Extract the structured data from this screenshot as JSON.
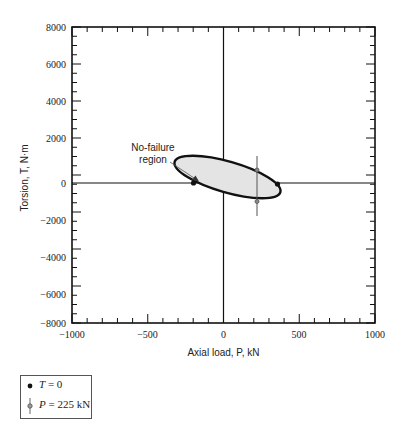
{
  "chart_data": {
    "type": "line",
    "title": "",
    "xlabel": "Axial load, P, kN",
    "ylabel": "Torsion, T, N·m",
    "xlim": [
      -1000,
      1000
    ],
    "ylim": [
      -8000,
      8000
    ],
    "x_ticks": [
      -1000,
      -500,
      0,
      500,
      1000
    ],
    "x_tick_labels": [
      "−1000",
      "−500",
      "0",
      "500",
      "1000"
    ],
    "y_ticks": [
      -8000,
      -6000,
      -4000,
      -2000,
      0,
      2000,
      4000,
      6000,
      8000
    ],
    "y_tick_labels": [
      "−8000",
      "−6000",
      "−4000",
      "−2000",
      "0",
      "2000",
      "4000",
      "6000",
      "8000"
    ],
    "grid": false,
    "series": [
      {
        "name": "No-failure region (ellipse boundary)",
        "shape": "ellipse",
        "fill": "#e6e6e6",
        "stroke": "#111111",
        "extent_P": [
          -330,
          375
        ],
        "extent_T": [
          -1600,
          1700
        ]
      },
      {
        "name": "T = 0",
        "marker": "filled-circle",
        "points": [
          {
            "P": -200,
            "T": 0
          },
          {
            "P": 360,
            "T": 0
          }
        ]
      },
      {
        "name": "P = 225 kN",
        "marker": "open-circle-with-vertical-line",
        "points": [
          {
            "P": 225,
            "T": 700
          },
          {
            "P": 225,
            "T": -1000
          }
        ],
        "line_T_range": [
          -1800,
          1500
        ]
      }
    ],
    "annotations": [
      {
        "text": "No-failure\nregion",
        "arrow_to": {
          "P": -100,
          "T": 800
        }
      }
    ],
    "legend": {
      "position": "bottom-left-outside",
      "entries": [
        "T = 0",
        "P = 225 kN"
      ]
    }
  },
  "labels": {
    "xlabel": "Axial load, P, kN",
    "ylabel": "Torsion, T, N·m",
    "annot_line1": "No-failure",
    "annot_line2": "region",
    "legend_t_var": "T",
    "legend_t_rest": " = 0",
    "legend_p_var": "P",
    "legend_p_rest": " = 225 kN",
    "x_ticks": [
      "−1000",
      "−500",
      "0",
      "500",
      "1000"
    ],
    "y_ticks": [
      "8000",
      "6000",
      "4000",
      "2000",
      "0",
      "−2000",
      "−4000",
      "−6000",
      "−8000"
    ]
  }
}
